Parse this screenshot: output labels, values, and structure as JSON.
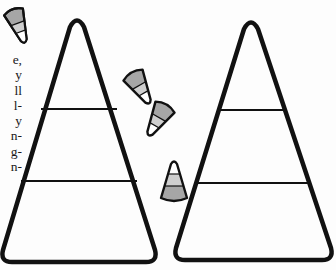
{
  "page": {
    "edge_text_fragments": [
      "e,",
      "y",
      "ll",
      "l-",
      "y",
      "n-",
      "g-",
      "n-"
    ]
  },
  "illustration": {
    "large_cones": [
      {
        "name": "left-cone",
        "apex": [
          77,
          20
        ],
        "bottom_left": [
          2,
          262
        ],
        "bottom_right": [
          157,
          262
        ],
        "band_lines_y": [
          109,
          181
        ]
      },
      {
        "name": "right-cone",
        "apex": [
          251,
          22
        ],
        "bottom_left": [
          174,
          260
        ],
        "bottom_right": [
          332,
          260
        ],
        "band_lines_y": [
          110,
          183
        ]
      }
    ],
    "small_candies": [
      {
        "name": "candy-top-left",
        "tip": "down"
      },
      {
        "name": "candy-middle-1",
        "tip": "down-right"
      },
      {
        "name": "candy-middle-2",
        "tip": "down-left"
      },
      {
        "name": "candy-middle-3",
        "tip": "up"
      }
    ],
    "colors": {
      "outline": "#111111",
      "band_dark": "#a6a6a6",
      "band_light": "#cfcfcf",
      "tip": "#ffffff",
      "background": "#fdfdfd"
    }
  }
}
